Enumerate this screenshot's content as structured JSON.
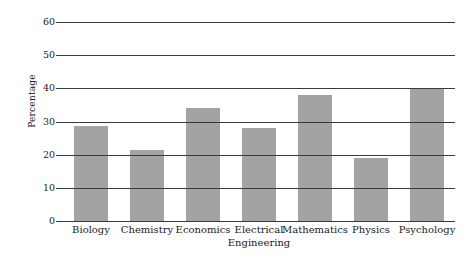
{
  "chart_data": {
    "type": "bar",
    "title": "",
    "subtitle": "",
    "xlabel": "",
    "ylabel": "Percentage",
    "categories": [
      "Biology",
      "Chemistry",
      "Economics",
      "Electrical Engineering",
      "Mathematics",
      "Physics",
      "Psychology"
    ],
    "category_lines": [
      [
        "Biology",
        ""
      ],
      [
        "Chemistry",
        ""
      ],
      [
        "Economics",
        ""
      ],
      [
        "Electrical",
        "Engineering"
      ],
      [
        "Mathematics",
        ""
      ],
      [
        "Physics",
        ""
      ],
      [
        "Psychology",
        ""
      ]
    ],
    "values": [
      28.5,
      21.5,
      34,
      28,
      38,
      19,
      40
    ],
    "ylim": [
      0,
      60
    ],
    "yticks": [
      0,
      10,
      20,
      30,
      40,
      50,
      60
    ],
    "ytick_labels": [
      "0",
      "10",
      "20",
      "30",
      "40",
      "50",
      "60"
    ],
    "grid": "horizontal",
    "legend": "none",
    "bar_color": "#a3a3a3",
    "gridline_color": "#3a3a3a",
    "background_color": "#ffffff",
    "text_color": "#1a1a1a"
  }
}
